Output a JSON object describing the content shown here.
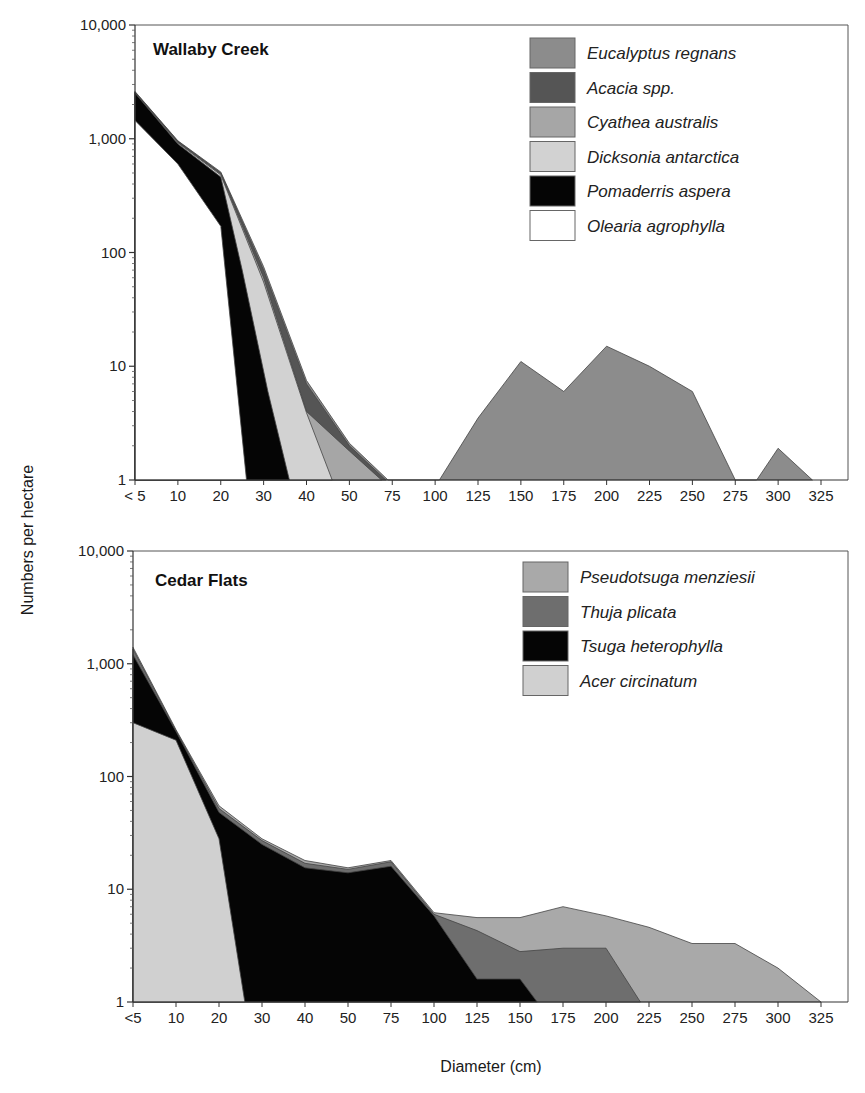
{
  "figure": {
    "ylabel": "Numbers per hectare",
    "xlabel": "Diameter (cm)"
  },
  "chart_data": [
    {
      "type": "area",
      "stacked": true,
      "title": "Wallaby Creek",
      "xlabel": "Diameter (cm)",
      "ylabel": "Numbers per hectare",
      "yscale": "log",
      "ylim": [
        1,
        10000
      ],
      "yticks": [
        "1",
        "10",
        "100",
        "1,000",
        "10,000"
      ],
      "categories": [
        "< 5",
        "10",
        "20",
        "30",
        "40",
        "50",
        "75",
        "100",
        "125",
        "150",
        "175",
        "200",
        "225",
        "250",
        "275",
        "300",
        "325"
      ],
      "legend": [
        {
          "name": "Eucalyptus regnans",
          "color": "#8c8c8c"
        },
        {
          "name": "Acacia spp.",
          "color": "#555555"
        },
        {
          "name": "Cyathea australis",
          "color": "#a6a6a6"
        },
        {
          "name": "Dicksonia antarctica",
          "color": "#d2d2d2"
        },
        {
          "name": "Pomaderris aspera",
          "color": "#050505"
        },
        {
          "name": "Olearia agrophylla",
          "color": "#ffffff"
        }
      ],
      "layers_cumulative_top": [
        {
          "name": "Eucalyptus regnans",
          "color": "#8c8c8c",
          "points": [
            [
              0,
              2600
            ],
            [
              1,
              960
            ],
            [
              2,
              510
            ],
            [
              3,
              75
            ],
            [
              4,
              7.5
            ],
            [
              5,
              2.1
            ],
            [
              5.9,
              1
            ],
            [
              7.1,
              1
            ],
            [
              8,
              3.5
            ],
            [
              9,
              11
            ],
            [
              10,
              6
            ],
            [
              11,
              15
            ],
            [
              12,
              10
            ],
            [
              13,
              6
            ],
            [
              14,
              1
            ],
            [
              14.5,
              1
            ],
            [
              15,
              1.9
            ],
            [
              15.8,
              1
            ]
          ]
        },
        {
          "name": "Acacia spp.",
          "color": "#555555",
          "points": [
            [
              0,
              2580
            ],
            [
              1,
              950
            ],
            [
              2,
              500
            ],
            [
              3,
              70
            ],
            [
              4,
              7
            ],
            [
              5,
              2
            ],
            [
              5.85,
              1
            ]
          ]
        },
        {
          "name": "Cyathea australis",
          "color": "#a6a6a6",
          "points": [
            [
              0,
              2550
            ],
            [
              1,
              930
            ],
            [
              2,
              490
            ],
            [
              3,
              60
            ],
            [
              4,
              4
            ],
            [
              5,
              1.8
            ],
            [
              5.75,
              1
            ]
          ]
        },
        {
          "name": "Dicksonia antarctica",
          "color": "#d2d2d2",
          "points": [
            [
              0,
              2540
            ],
            [
              1,
              920
            ],
            [
              2,
              480
            ],
            [
              3,
              55
            ],
            [
              4,
              3.9
            ],
            [
              4.6,
              1
            ]
          ]
        },
        {
          "name": "Pomaderris aspera",
          "color": "#050505",
          "points": [
            [
              0,
              2520
            ],
            [
              1,
              900
            ],
            [
              2,
              460
            ],
            [
              2.5,
              70
            ],
            [
              3.1,
              6
            ],
            [
              3.6,
              1
            ]
          ]
        },
        {
          "name": "Olearia agrophylla",
          "color": "#ffffff",
          "points": [
            [
              0,
              1450
            ],
            [
              1,
              600
            ],
            [
              2,
              170
            ],
            [
              2.6,
              1
            ]
          ]
        }
      ]
    },
    {
      "type": "area",
      "stacked": true,
      "title": "Cedar Flats",
      "xlabel": "Diameter (cm)",
      "ylabel": "Numbers per hectare",
      "yscale": "log",
      "ylim": [
        1,
        10000
      ],
      "yticks": [
        "1",
        "10",
        "100",
        "1,000",
        "10,000"
      ],
      "categories": [
        "<5",
        "10",
        "20",
        "30",
        "40",
        "50",
        "75",
        "100",
        "125",
        "150",
        "175",
        "200",
        "225",
        "250",
        "275",
        "300",
        "325"
      ],
      "legend": [
        {
          "name": "Pseudotsuga menziesii",
          "color": "#a9a9a9"
        },
        {
          "name": "Thuja plicata",
          "color": "#6e6e6e"
        },
        {
          "name": "Tsuga heterophylla",
          "color": "#050505"
        },
        {
          "name": "Acer circinatum",
          "color": "#d0d0d0"
        }
      ],
      "layers_cumulative_top": [
        {
          "name": "Pseudotsuga menziesii",
          "color": "#a9a9a9",
          "points": [
            [
              0,
              1400
            ],
            [
              1,
              260
            ],
            [
              2,
              55
            ],
            [
              3,
              28
            ],
            [
              4,
              18
            ],
            [
              5,
              15.5
            ],
            [
              6,
              18
            ],
            [
              7,
              6.2
            ],
            [
              8,
              5.6
            ],
            [
              9,
              5.6
            ],
            [
              10,
              7
            ],
            [
              11,
              5.8
            ],
            [
              12,
              4.6
            ],
            [
              13,
              3.3
            ],
            [
              14,
              3.3
            ],
            [
              15,
              2
            ],
            [
              16,
              1
            ]
          ]
        },
        {
          "name": "Thuja plicata",
          "color": "#6e6e6e",
          "points": [
            [
              0,
              1350
            ],
            [
              1,
              255
            ],
            [
              2,
              52
            ],
            [
              3,
              27
            ],
            [
              4,
              17
            ],
            [
              5,
              15
            ],
            [
              6,
              17.5
            ],
            [
              7,
              6
            ],
            [
              8,
              4.3
            ],
            [
              9,
              2.8
            ],
            [
              10,
              3
            ],
            [
              11,
              3
            ],
            [
              11.8,
              1
            ]
          ]
        },
        {
          "name": "Tsuga heterophylla",
          "color": "#050505",
          "points": [
            [
              0,
              1200
            ],
            [
              1,
              250
            ],
            [
              2,
              48
            ],
            [
              3,
              25
            ],
            [
              4,
              15.5
            ],
            [
              5,
              14
            ],
            [
              6,
              16
            ],
            [
              7,
              5.8
            ],
            [
              8,
              1.6
            ],
            [
              9,
              1.6
            ],
            [
              9.4,
              1
            ]
          ]
        },
        {
          "name": "Acer circinatum",
          "color": "#d0d0d0",
          "points": [
            [
              0,
              300
            ],
            [
              1,
              210
            ],
            [
              2,
              28
            ],
            [
              2.6,
              1
            ]
          ]
        }
      ]
    }
  ]
}
